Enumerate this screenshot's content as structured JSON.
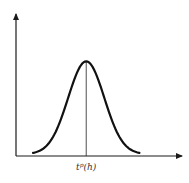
{
  "figure": {
    "title": "",
    "peak_label": {
      "base": "t",
      "superscript": "p",
      "argument": "(h)"
    },
    "x_axis_label": "",
    "y_axis_label": ""
  },
  "chart_data": {
    "type": "line",
    "title": "",
    "xlabel": "",
    "ylabel": "",
    "shape": "bell",
    "annotations": [
      {
        "label": "t^p(h)",
        "position": "peak"
      }
    ],
    "x": [
      -2.5,
      -2,
      -1.5,
      -1,
      -0.5,
      0,
      0.5,
      1,
      1.5,
      2,
      2.5
    ],
    "values": [
      0.04,
      0.14,
      0.32,
      0.6,
      0.9,
      1.0,
      0.9,
      0.6,
      0.32,
      0.14,
      0.04
    ],
    "xlim": [
      -3.3,
      4.5
    ],
    "ylim": [
      0,
      1.05
    ],
    "grid": false
  }
}
